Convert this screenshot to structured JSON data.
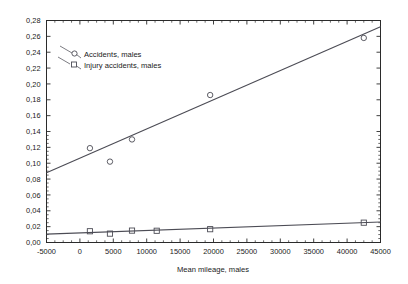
{
  "chart_data": {
    "type": "scatter",
    "title": "",
    "xlabel": "Mean mileage, males",
    "ylabel": "",
    "xlim": [
      -5000,
      45000
    ],
    "ylim": [
      0.0,
      0.28
    ],
    "grid": false,
    "legend_position": "top-left",
    "decimal_separator": ",",
    "xticks": [
      -5000,
      0,
      5000,
      10000,
      15000,
      20000,
      25000,
      30000,
      35000,
      40000,
      45000
    ],
    "xtick_labels": [
      "-5000",
      "0",
      "5000",
      "10000",
      "15000",
      "20000",
      "25000",
      "30000",
      "35000",
      "40000",
      "45000"
    ],
    "yticks": [
      0.0,
      0.02,
      0.04,
      0.06,
      0.08,
      0.1,
      0.12,
      0.14,
      0.16,
      0.18,
      0.2,
      0.22,
      0.24,
      0.26,
      0.28
    ],
    "ytick_labels": [
      "0,00",
      "0,02",
      "0,04",
      "0,06",
      "0,08",
      "0,10",
      "0,12",
      "0,14",
      "0,16",
      "0,18",
      "0,20",
      "0,22",
      "0,24",
      "0,26",
      "0,28"
    ],
    "series": [
      {
        "name": "Accidents, males",
        "marker": "circle",
        "color": "#4c4c55",
        "points": [
          {
            "x": 1500,
            "y": 0.119
          },
          {
            "x": 4500,
            "y": 0.102
          },
          {
            "x": 7800,
            "y": 0.13
          },
          {
            "x": 19500,
            "y": 0.186
          },
          {
            "x": 42500,
            "y": 0.258
          }
        ],
        "fit_line": {
          "x1": -5000,
          "y1": 0.088,
          "x2": 45000,
          "y2": 0.272
        }
      },
      {
        "name": "Injury accidents, males",
        "marker": "square",
        "color": "#4c4c55",
        "points": [
          {
            "x": 1500,
            "y": 0.0142
          },
          {
            "x": 4500,
            "y": 0.0112
          },
          {
            "x": 7800,
            "y": 0.015
          },
          {
            "x": 11500,
            "y": 0.0148
          },
          {
            "x": 19500,
            "y": 0.0168
          },
          {
            "x": 42500,
            "y": 0.025
          }
        ],
        "fit_line": {
          "x1": -5000,
          "y1": 0.0105,
          "x2": 45000,
          "y2": 0.0258
        }
      }
    ]
  },
  "legend": {
    "items": [
      {
        "label": "Accidents, males",
        "marker": "circle"
      },
      {
        "label": "Injury accidents, males",
        "marker": "square"
      }
    ]
  },
  "axes": {
    "x_title": "Mean mileage, males"
  }
}
